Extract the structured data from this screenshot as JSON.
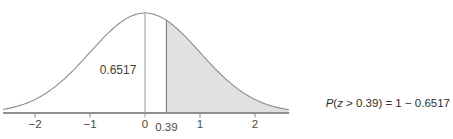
{
  "page": {
    "background": "#ffffff"
  },
  "chart_data": {
    "type": "area",
    "title": "",
    "x_range": [
      -2.58,
      2.62
    ],
    "x_ticks": [
      -2,
      -1,
      0,
      1,
      2
    ],
    "x_tick_labels": [
      "−2",
      "−1",
      "0",
      "1",
      "2"
    ],
    "shade_from": 0.39,
    "boundary_label": "0.39",
    "area_left_label": "0.6517",
    "area_left_value": 0.6517,
    "area_right_value": 0.3483,
    "grid": false,
    "legend": false,
    "colors": {
      "shade": "#e1e1e1",
      "curve": "#8f8f8f",
      "axis": "#8f8f8f",
      "zero_line": "#a3a3a3",
      "boundary_line": "#8a8a8a",
      "text": "#3f3f3f"
    }
  },
  "formula": {
    "p": "P",
    "open": "(",
    "z": "z",
    "rest": " > 0.39) = 1 − 0.6517",
    "line2": "= 0.3483",
    "qed_symbol": "end-of-solution-square"
  }
}
